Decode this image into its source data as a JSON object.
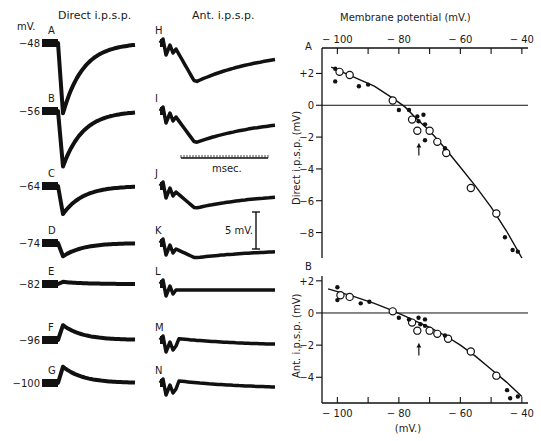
{
  "figure": {
    "left_column_title": "Direct i.p.s.p.",
    "middle_column_title": "Ant. i.p.s.p.",
    "units_label": "mV.",
    "time_scale_label": "msec.",
    "voltage_scale_label": "5 mV.",
    "direct_traces": [
      {
        "letter": "A",
        "potential": "−48",
        "amplitude_mv": -9.5
      },
      {
        "letter": "B",
        "potential": "−56",
        "amplitude_mv": -7.5
      },
      {
        "letter": "C",
        "potential": "−64",
        "amplitude_mv": -3.8
      },
      {
        "letter": "D",
        "potential": "−74",
        "amplitude_mv": -1.8
      },
      {
        "letter": "E",
        "potential": "−82",
        "amplitude_mv": 0.3
      },
      {
        "letter": "F",
        "potential": "−96",
        "amplitude_mv": 2.0
      },
      {
        "letter": "G",
        "potential": "−100",
        "amplitude_mv": 2.2
      }
    ],
    "antidromic_traces": [
      {
        "letter": "H",
        "amplitude_mv": -4.5
      },
      {
        "letter": "I",
        "amplitude_mv": -3.5
      },
      {
        "letter": "J",
        "amplitude_mv": -2.2
      },
      {
        "letter": "K",
        "amplitude_mv": -1.2
      },
      {
        "letter": "L",
        "amplitude_mv": 0.0
      },
      {
        "letter": "M",
        "amplitude_mv": 1.0
      },
      {
        "letter": "N",
        "amplitude_mv": 1.1
      }
    ]
  },
  "chart_data": [
    {
      "type": "scatter",
      "panel": "A",
      "title": "Membrane potential (mV.)",
      "xlabel": "Membrane potential (mV.)",
      "ylabel": "Direct i.p.s.p. (mV)",
      "xlim": [
        -105,
        -38
      ],
      "ylim": [
        -9.6,
        3.6
      ],
      "xticks": [
        -100,
        -90,
        -80,
        -70,
        -60,
        -50,
        -40
      ],
      "xtick_labels": [
        "− 100",
        "",
        "− 80",
        "",
        "− 60",
        "",
        "− 40"
      ],
      "yticks": [
        2,
        0,
        -2,
        -4,
        -6,
        -8
      ],
      "ytick_labels": [
        "+2",
        "0",
        "−2",
        "−4",
        "−6",
        "−8"
      ],
      "zero_line": true,
      "arrow_at": [
        -73.5,
        -2.4
      ],
      "series": [
        {
          "name": "open circles",
          "marker": "open-circle",
          "points": [
            [
              -99.3,
              2.1
            ],
            [
              -96,
              1.9
            ],
            [
              -82,
              0.3
            ],
            [
              -75.7,
              -0.9
            ],
            [
              -74,
              -1.6
            ],
            [
              -70,
              -1.6
            ],
            [
              -67.5,
              -2.3
            ],
            [
              -64.6,
              -3.0
            ],
            [
              -56.6,
              -5.2
            ],
            [
              -48.3,
              -6.8
            ]
          ]
        },
        {
          "name": "filled dots",
          "marker": "filled-dot",
          "points": [
            [
              -100.7,
              2.3
            ],
            [
              -100.7,
              1.5
            ],
            [
              -93,
              1.2
            ],
            [
              -90,
              1.3
            ],
            [
              -80,
              -0.3
            ],
            [
              -76.7,
              -0.3
            ],
            [
              -74,
              -0.7
            ],
            [
              -73.6,
              -1.0
            ],
            [
              -72,
              -0.6
            ],
            [
              -71.5,
              -1.2
            ],
            [
              -71.5,
              -2.2
            ],
            [
              -65,
              -2.7
            ],
            [
              -45.5,
              -8.3
            ],
            [
              -43,
              -9.1
            ],
            [
              -41.3,
              -9.2
            ]
          ]
        },
        {
          "name": "fitted curve",
          "marker": "line",
          "points": [
            [
              -102,
              2.4
            ],
            [
              -95,
              1.8
            ],
            [
              -88,
              1.2
            ],
            [
              -82,
              0.45
            ],
            [
              -78,
              -0.1
            ],
            [
              -74,
              -0.9
            ],
            [
              -70,
              -1.6
            ],
            [
              -65,
              -2.7
            ],
            [
              -60,
              -3.9
            ],
            [
              -55,
              -5.1
            ],
            [
              -50,
              -6.4
            ],
            [
              -45,
              -7.9
            ],
            [
              -40,
              -9.6
            ]
          ]
        }
      ]
    },
    {
      "type": "scatter",
      "panel": "B",
      "xlabel": "(mV.)",
      "ylabel": "Ant. i.p.s.p. (mV)",
      "xlim": [
        -105,
        -38
      ],
      "ylim": [
        -5.6,
        2.3
      ],
      "xticks": [
        -100,
        -90,
        -80,
        -70,
        -60,
        -50,
        -40
      ],
      "xtick_labels": [
        "− 100",
        "",
        "− 80",
        "",
        "− 60",
        "",
        "− 40"
      ],
      "yticks": [
        2,
        0,
        -2,
        -4
      ],
      "ytick_labels": [
        "+2",
        "0",
        "−2",
        "−4"
      ],
      "zero_line": true,
      "arrow_at": [
        -73.5,
        -1.9
      ],
      "series": [
        {
          "name": "open circles",
          "marker": "open-circle",
          "points": [
            [
              -99,
              1.1
            ],
            [
              -96,
              1.0
            ],
            [
              -82,
              0.1
            ],
            [
              -75.7,
              -0.6
            ],
            [
              -74,
              -1.1
            ],
            [
              -70,
              -1.1
            ],
            [
              -67.5,
              -1.3
            ],
            [
              -64,
              -1.6
            ],
            [
              -56.6,
              -2.4
            ],
            [
              -48.3,
              -3.9
            ]
          ]
        },
        {
          "name": "filled dots",
          "marker": "filled-dot",
          "points": [
            [
              -100,
              1.6
            ],
            [
              -100,
              0.8
            ],
            [
              -92.4,
              0.6
            ],
            [
              -89.6,
              0.7
            ],
            [
              -80,
              -0.3
            ],
            [
              -76.7,
              -0.4
            ],
            [
              -73.6,
              -0.3
            ],
            [
              -73,
              -0.7
            ],
            [
              -71.5,
              -0.4
            ],
            [
              -71.5,
              -0.8
            ],
            [
              -65,
              -1.4
            ],
            [
              -44.8,
              -4.8
            ],
            [
              -43.8,
              -5.3
            ],
            [
              -41.3,
              -5.2
            ]
          ]
        },
        {
          "name": "fitted curve",
          "marker": "line",
          "points": [
            [
              -103,
              1.5
            ],
            [
              -95,
              1.05
            ],
            [
              -88,
              0.6
            ],
            [
              -82,
              0.15
            ],
            [
              -78,
              -0.2
            ],
            [
              -74,
              -0.55
            ],
            [
              -70,
              -0.9
            ],
            [
              -65,
              -1.4
            ],
            [
              -60,
              -2.0
            ],
            [
              -55,
              -2.7
            ],
            [
              -50,
              -3.5
            ],
            [
              -45,
              -4.3
            ],
            [
              -40,
              -5.2
            ]
          ]
        }
      ]
    }
  ]
}
